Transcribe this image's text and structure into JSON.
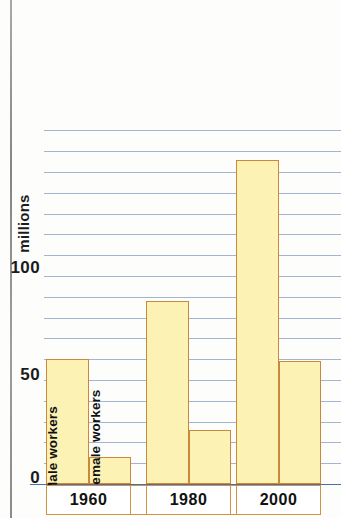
{
  "chart_data": {
    "type": "bar",
    "title": "",
    "subtitle": "",
    "xlabel": "",
    "ylabel": "millions",
    "categories": [
      "1960",
      "1980",
      "2000"
    ],
    "series": [
      {
        "name": "Male workers",
        "values": [
          60,
          88,
          156
        ]
      },
      {
        "name": "Female workers",
        "values": [
          13,
          26,
          59
        ]
      }
    ],
    "ylim": [
      0,
      170
    ],
    "yticks": [
      0,
      50,
      100
    ],
    "ytick_labels": [
      "0",
      "50",
      "100"
    ],
    "grid": true,
    "grid_interval": 10,
    "grid_orientation": "horizontal",
    "legend": "inline-rotated-labels-on-first-group",
    "legend_position": "inside-bars-1960",
    "colors": {
      "bar_fill": "#fbf2b4",
      "bar_border": "#c9883c",
      "gridline": "#6f86b4",
      "axis": "#4a6ea8",
      "text": "#111111",
      "box_border": "#d4913f"
    }
  },
  "axis": {
    "y_title": "millions",
    "tick_100": "100",
    "tick_50": "50",
    "tick_0": "0"
  },
  "bar_labels": {
    "male": "Male workers",
    "female": "Female workers"
  },
  "groups": {
    "g1960": "1960",
    "g1980": "1980",
    "g2000": "2000"
  }
}
